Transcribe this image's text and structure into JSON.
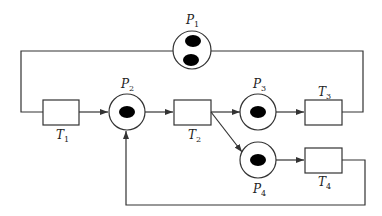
{
  "diagram": {
    "type": "petri-net",
    "stroke_color": "#333333",
    "token_color": "#000000",
    "places": [
      {
        "id": "P1",
        "letter": "P",
        "sub": "1",
        "tokens": 2
      },
      {
        "id": "P2",
        "letter": "P",
        "sub": "2",
        "tokens": 1
      },
      {
        "id": "P3",
        "letter": "P",
        "sub": "3",
        "tokens": 1
      },
      {
        "id": "P4",
        "letter": "P",
        "sub": "4",
        "tokens": 1
      }
    ],
    "transitions": [
      {
        "id": "T1",
        "letter": "T",
        "sub": "1"
      },
      {
        "id": "T2",
        "letter": "T",
        "sub": "2"
      },
      {
        "id": "T3",
        "letter": "T",
        "sub": "3"
      },
      {
        "id": "T4",
        "letter": "T",
        "sub": "4"
      }
    ],
    "arcs": [
      {
        "from": "P1",
        "to": "T1"
      },
      {
        "from": "T1",
        "to": "P2"
      },
      {
        "from": "P2",
        "to": "T2"
      },
      {
        "from": "T2",
        "to": "P3"
      },
      {
        "from": "T2",
        "to": "P4"
      },
      {
        "from": "P3",
        "to": "T3"
      },
      {
        "from": "T3",
        "to": "P1"
      },
      {
        "from": "P4",
        "to": "T4"
      },
      {
        "from": "T4",
        "to": "P2"
      }
    ]
  }
}
